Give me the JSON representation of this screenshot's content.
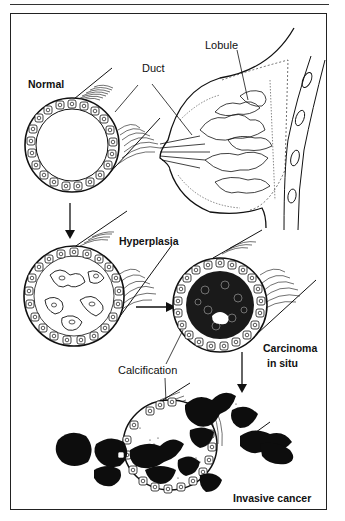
{
  "figure": {
    "type": "medical-illustration",
    "labels": {
      "normal": "Normal",
      "duct": "Duct",
      "lobule": "Lobule",
      "hyperplasia": "Hyperplasia",
      "carcinoma_line1": "Carcinoma",
      "carcinoma_line2": "in situ",
      "calcification": "Calcification",
      "invasive": "Invasive cancer"
    },
    "stages": [
      {
        "name": "Normal",
        "description": "open duct lined by single cell layer"
      },
      {
        "name": "Hyperplasia",
        "description": "duct lumen partially filled with proliferating cells"
      },
      {
        "name": "Carcinoma in situ",
        "description": "duct lumen filled with dark abnormal cells, calcification"
      },
      {
        "name": "Invasive cancer",
        "description": "dark cells breaking through duct wall"
      }
    ],
    "colors": {
      "ink": "#111111",
      "paper": "#ffffff"
    }
  }
}
